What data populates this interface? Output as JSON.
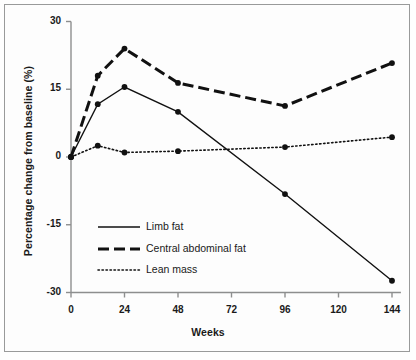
{
  "chart_data": {
    "type": "line",
    "title": "",
    "xlabel": "Weeks",
    "ylabel": "Percentage change from baseline (%)",
    "x": [
      0,
      12,
      24,
      48,
      96,
      144
    ],
    "xlim": [
      0,
      148
    ],
    "ylim": [
      -30,
      30
    ],
    "xticks": [
      "0",
      "24",
      "48",
      "72",
      "96",
      "120",
      "144"
    ],
    "xtick_values": [
      0,
      24,
      48,
      72,
      96,
      120,
      144
    ],
    "yticks": [
      "30",
      "15",
      "0",
      "-15",
      "-30"
    ],
    "ytick_values": [
      30,
      15,
      0,
      -15,
      -30
    ],
    "grid": false,
    "legend_position": "inside-lower-left",
    "series": [
      {
        "name": "Limb fat",
        "style": "solid",
        "color": "#111111",
        "values": [
          0,
          11.7,
          15.5,
          10.0,
          -8.2,
          -27.4
        ]
      },
      {
        "name": "Central abdominal fat",
        "style": "dashed",
        "color": "#111111",
        "values": [
          0,
          18.0,
          24.0,
          16.4,
          11.3,
          20.8
        ]
      },
      {
        "name": "Lean mass",
        "style": "dotted",
        "color": "#111111",
        "values": [
          0,
          2.5,
          1.0,
          1.3,
          2.2,
          4.4
        ]
      }
    ]
  },
  "legend": {
    "items": [
      {
        "label": "Limb fat"
      },
      {
        "label": "Central abdominal fat"
      },
      {
        "label": "Lean mass"
      }
    ]
  }
}
